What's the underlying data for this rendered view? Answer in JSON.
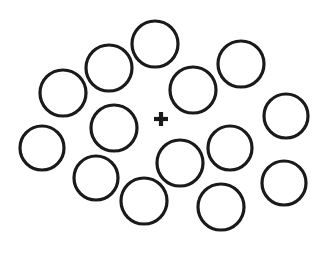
{
  "figure": {
    "name": "ebbinghaus-illusion-stimulus",
    "width": 324,
    "height": 262,
    "background_color": "#ffffff",
    "stroke_color": "#1a1a1a",
    "fixation_color": "#1a1a1a"
  },
  "fixation": {
    "symbol": "+",
    "cx": 161,
    "cy": 119,
    "arm_length": 14,
    "thickness": 4.2
  },
  "circles": [
    {
      "id": "circle-01",
      "label": "top-center",
      "cx": 155,
      "cy": 44,
      "r": 23,
      "stroke_width": 3.2
    },
    {
      "id": "circle-02",
      "label": "upper-left",
      "cx": 109,
      "cy": 68,
      "r": 23,
      "stroke_width": 3.2
    },
    {
      "id": "circle-03",
      "label": "left-upper",
      "cx": 63,
      "cy": 93,
      "r": 23,
      "stroke_width": 3.2
    },
    {
      "id": "circle-04",
      "label": "far-left-lower",
      "cx": 42,
      "cy": 148,
      "r": 22,
      "stroke_width": 3.2
    },
    {
      "id": "circle-05",
      "label": "center-left",
      "cx": 114,
      "cy": 128,
      "r": 23,
      "stroke_width": 3.2
    },
    {
      "id": "circle-06",
      "label": "lower-left",
      "cx": 96,
      "cy": 178,
      "r": 22,
      "stroke_width": 3.2
    },
    {
      "id": "circle-07",
      "label": "bottom-center-left",
      "cx": 144,
      "cy": 201,
      "r": 23,
      "stroke_width": 3.2
    },
    {
      "id": "circle-08",
      "label": "center-below-fixation",
      "cx": 180,
      "cy": 163,
      "r": 23,
      "stroke_width": 3.2
    },
    {
      "id": "circle-09",
      "label": "upper-right-of-fixation",
      "cx": 193,
      "cy": 90,
      "r": 23,
      "stroke_width": 3.2
    },
    {
      "id": "circle-10",
      "label": "top-right",
      "cx": 241,
      "cy": 64,
      "r": 23,
      "stroke_width": 3.2
    },
    {
      "id": "circle-11",
      "label": "right-middle-inner",
      "cx": 230,
      "cy": 148,
      "r": 22,
      "stroke_width": 3.2
    },
    {
      "id": "circle-12",
      "label": "far-right-upper",
      "cx": 286,
      "cy": 116,
      "r": 22,
      "stroke_width": 3.2
    },
    {
      "id": "circle-13",
      "label": "far-right-lower",
      "cx": 284,
      "cy": 183,
      "r": 22,
      "stroke_width": 3.2
    },
    {
      "id": "circle-14",
      "label": "bottom-right",
      "cx": 221,
      "cy": 207,
      "r": 23,
      "stroke_width": 3.2
    }
  ]
}
